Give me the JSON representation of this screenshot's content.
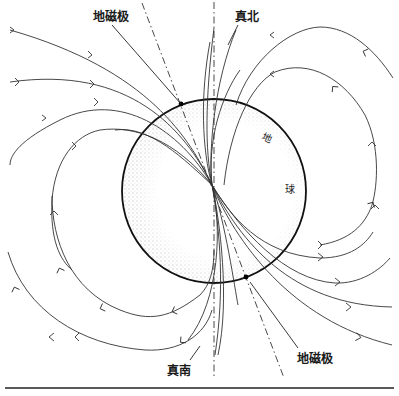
{
  "figure": {
    "type": "geomagnetic-field-diagram",
    "labels": {
      "magnetic_pole_north": "地磁极",
      "true_north": "真北",
      "true_south": "真南",
      "magnetic_pole_south": "地磁极",
      "earth_char_1": "地",
      "earth_char_2": "球"
    },
    "colors": {
      "line": "#333333",
      "earth_outline": "#111111",
      "stipple": "#555555",
      "background": "#ffffff"
    },
    "earth": {
      "cx": 214,
      "cy": 191,
      "r": 92
    }
  }
}
